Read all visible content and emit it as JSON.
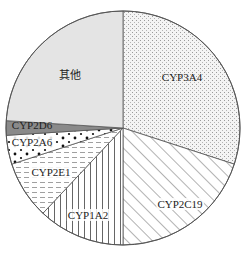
{
  "chart_data": {
    "type": "pie",
    "title": "",
    "start_angle_deg": 0,
    "direction": "clockwise",
    "slices": [
      {
        "label": "CYP3A4",
        "value": 30,
        "pattern": "fine-dots",
        "fill": "#f2f2f2",
        "label_x": 182,
        "label_y": 81,
        "label_bg": false
      },
      {
        "label": "CYP2C19",
        "value": 20,
        "pattern": "diagonal-hatch",
        "fill": "#ffffff",
        "label_x": 180,
        "label_y": 208,
        "label_bg": true
      },
      {
        "label": "CYP1A2",
        "value": 12,
        "pattern": "vertical-lines",
        "fill": "#ffffff",
        "label_x": 88,
        "label_y": 219,
        "label_bg": true
      },
      {
        "label": "CYP2E1",
        "value": 8,
        "pattern": "dashed-horizontal",
        "fill": "#ffffff",
        "label_x": 51,
        "label_y": 176,
        "label_bg": true
      },
      {
        "label": "CYP2A6",
        "value": 4,
        "pattern": "large-dots",
        "fill": "#ffffff",
        "label_x": 32,
        "label_y": 146,
        "label_bg": true
      },
      {
        "label": "CYP2D6",
        "value": 2,
        "pattern": "solid",
        "fill": "#8a8a8a",
        "label_x": 32,
        "label_y": 129,
        "label_bg": false
      },
      {
        "label": "其他",
        "value": 24,
        "pattern": "solid",
        "fill": "#e4e4e4",
        "label_x": 70,
        "label_y": 79,
        "label_bg": false
      }
    ],
    "legend": "none",
    "labels_inside": true
  },
  "layout": {
    "cx": 123,
    "cy": 128,
    "r": 117,
    "stroke": "#555555"
  }
}
